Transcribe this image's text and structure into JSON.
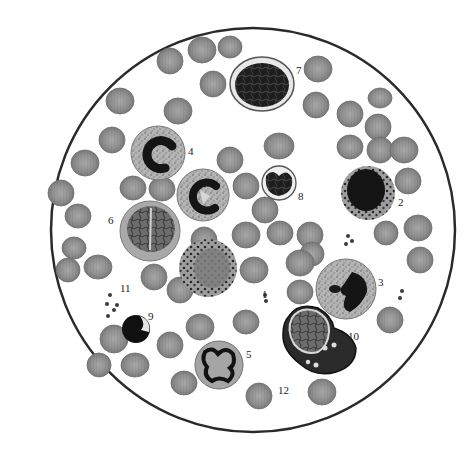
{
  "figure": {
    "width": 467,
    "height": 453,
    "field": {
      "cx": 253,
      "cy": 230,
      "r": 202,
      "stroke": "#2a2a2a"
    },
    "colors": {
      "rbc": "#8c8c8c",
      "rbc_edge": "#6e6e6e",
      "rbc_center": "#a6a6a6",
      "nucleus_dark": "#1a1a1a",
      "cytoplasm_light": "#bdbdbd",
      "cytoplasm_mid": "#9a9a9a",
      "granule": "#202020",
      "platelet": "#3a3a3a"
    }
  },
  "labels": [
    {
      "id": "1",
      "text": "1",
      "x": 262,
      "y": 298
    },
    {
      "id": "2",
      "text": "2",
      "x": 398,
      "y": 206
    },
    {
      "id": "3",
      "text": "3",
      "x": 378,
      "y": 286
    },
    {
      "id": "4",
      "text": "4",
      "x": 188,
      "y": 155
    },
    {
      "id": "5",
      "text": "5",
      "x": 246,
      "y": 358
    },
    {
      "id": "6",
      "text": "6",
      "x": 108,
      "y": 224
    },
    {
      "id": "7",
      "text": "7",
      "x": 296,
      "y": 74
    },
    {
      "id": "8",
      "text": "8",
      "x": 298,
      "y": 200
    },
    {
      "id": "9",
      "text": "9",
      "x": 148,
      "y": 320
    },
    {
      "id": "10",
      "text": "10",
      "x": 348,
      "y": 340
    },
    {
      "id": "11",
      "text": "11",
      "x": 120,
      "y": 292
    },
    {
      "id": "12",
      "text": "12",
      "x": 278,
      "y": 394
    }
  ],
  "cells": {
    "rbc": [
      [
        202,
        50,
        13
      ],
      [
        230,
        47,
        12
      ],
      [
        170,
        61,
        13
      ],
      [
        318,
        69,
        13
      ],
      [
        213,
        84,
        13
      ],
      [
        178,
        111,
        14
      ],
      [
        120,
        101,
        13
      ],
      [
        316,
        105,
        13
      ],
      [
        350,
        114,
        13
      ],
      [
        380,
        98,
        11
      ],
      [
        378,
        127,
        13
      ],
      [
        112,
        140,
        13
      ],
      [
        85,
        163,
        13
      ],
      [
        350,
        147,
        13
      ],
      [
        380,
        150,
        13
      ],
      [
        404,
        150,
        13
      ],
      [
        61,
        193,
        13
      ],
      [
        133,
        188,
        13
      ],
      [
        162,
        189,
        12
      ],
      [
        230,
        160,
        13
      ],
      [
        246,
        186,
        13
      ],
      [
        279,
        146,
        14
      ],
      [
        265,
        210,
        13
      ],
      [
        408,
        181,
        13
      ],
      [
        78,
        216,
        12
      ],
      [
        280,
        233,
        13
      ],
      [
        310,
        235,
        13
      ],
      [
        246,
        235,
        13
      ],
      [
        204,
        240,
        13
      ],
      [
        74,
        248,
        12
      ],
      [
        418,
        228,
        13
      ],
      [
        386,
        233,
        12
      ],
      [
        312,
        254,
        12
      ],
      [
        98,
        267,
        13
      ],
      [
        68,
        270,
        12
      ],
      [
        154,
        277,
        13
      ],
      [
        254,
        270,
        13
      ],
      [
        300,
        292,
        13
      ],
      [
        420,
        260,
        13
      ],
      [
        300,
        263,
        13
      ],
      [
        180,
        290,
        13
      ],
      [
        246,
        322,
        13
      ],
      [
        200,
        327,
        13
      ],
      [
        170,
        345,
        13
      ],
      [
        114,
        339,
        14
      ],
      [
        135,
        365,
        13
      ],
      [
        99,
        365,
        12
      ],
      [
        390,
        320,
        13
      ],
      [
        322,
        392,
        13
      ],
      [
        184,
        383,
        13
      ],
      [
        259,
        396,
        13
      ]
    ],
    "platelets": [
      [
        110,
        295,
        2
      ],
      [
        107,
        304,
        2
      ],
      [
        117,
        305,
        2
      ],
      [
        114,
        310,
        2
      ],
      [
        108,
        316,
        2
      ],
      [
        265,
        295,
        2
      ],
      [
        266,
        301,
        2
      ],
      [
        348,
        236,
        2
      ],
      [
        352,
        241,
        2
      ],
      [
        346,
        244,
        2
      ],
      [
        402,
        291,
        2
      ],
      [
        400,
        298,
        2
      ]
    ],
    "wbc": {
      "c1_basophil_like": {
        "cx": 208,
        "cy": 268,
        "r": 28
      },
      "c2": {
        "cx": 368,
        "cy": 193,
        "r": 26
      },
      "c3": {
        "cx": 346,
        "cy": 289,
        "r": 30
      },
      "c4": {
        "cx": 158,
        "cy": 153,
        "r": 27
      },
      "c5": {
        "cx": 219,
        "cy": 365,
        "r": 24
      },
      "c6": {
        "cx": 150,
        "cy": 231,
        "r": 29
      },
      "c7": {
        "cx": 262,
        "cy": 84,
        "r": 30
      },
      "c8": {
        "cx": 279,
        "cy": 183,
        "r": 17
      },
      "c9": {
        "cx": 136,
        "cy": 329,
        "r": 14
      },
      "c10": {
        "cx": 313,
        "cy": 339,
        "r": 36
      }
    }
  }
}
